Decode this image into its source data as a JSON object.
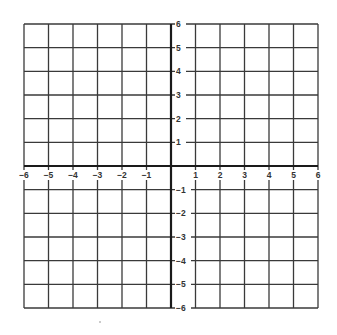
{
  "chart_data": {
    "type": "coordinate-grid",
    "title": "",
    "xlabel": "",
    "ylabel": "",
    "xlim": [
      -6,
      6
    ],
    "ylim": [
      -6,
      6
    ],
    "grid": true,
    "grid_step": 1,
    "legend": null,
    "x_tick_labels": [
      "−6",
      "−5",
      "−4",
      "−3",
      "−2",
      "−1",
      "1",
      "2",
      "3",
      "4",
      "5",
      "6"
    ],
    "y_tick_labels": [
      "6",
      "5",
      "4",
      "3",
      "2",
      "1",
      "−1",
      "−2",
      "−3",
      "−4",
      "−5",
      "−6"
    ],
    "x_ticks": [
      -6,
      -5,
      -4,
      -3,
      -2,
      -1,
      1,
      2,
      3,
      4,
      5,
      6
    ],
    "y_ticks": [
      6,
      5,
      4,
      3,
      2,
      1,
      -1,
      -2,
      -3,
      -4,
      -5,
      -6
    ],
    "series": []
  },
  "colors": {
    "grid": "#3a3a3a",
    "axis": "#1a1a1a",
    "label": "#333333",
    "background": "#ffffff"
  }
}
